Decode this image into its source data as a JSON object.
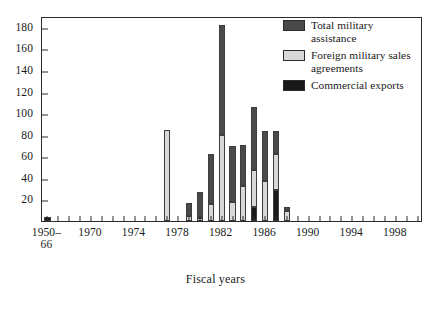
{
  "chart_data": {
    "type": "bar",
    "stacked": true,
    "title": "",
    "xlabel": "Fiscal years",
    "ylabel": "",
    "ylim": [
      0,
      190
    ],
    "yticks": [
      20,
      40,
      60,
      80,
      100,
      120,
      140,
      160,
      180
    ],
    "grid": false,
    "legend_position": "top-right",
    "categories": [
      "1950–66",
      "1967",
      "1968",
      "1969",
      "1970",
      "1971",
      "1972",
      "1973",
      "1974",
      "1975",
      "1976",
      "1977",
      "1978",
      "1979",
      "1980",
      "1981",
      "1982",
      "1983",
      "1984",
      "1985",
      "1986",
      "1987",
      "1988",
      "1989",
      "1990",
      "1991",
      "1992",
      "1993",
      "1994",
      "1995",
      "1996",
      "1997",
      "1998",
      "1999",
      "2000"
    ],
    "xtick_labels": [
      "1950–\n66",
      "1970",
      "1974",
      "1978",
      "1982",
      "1986",
      "1990",
      "1994",
      "1998"
    ],
    "xtick_categories": [
      "1950–66",
      "1970",
      "1974",
      "1978",
      "1982",
      "1986",
      "1990",
      "1994",
      "1998"
    ],
    "series": [
      {
        "name": "Commercial exports",
        "color": "#191919",
        "values": [
          4,
          0,
          0,
          0,
          0,
          0,
          0,
          0,
          0,
          0,
          0,
          0,
          0,
          0,
          0,
          0,
          0,
          0,
          0,
          13,
          0,
          29,
          0,
          0,
          0,
          0,
          0,
          0,
          0,
          0,
          0,
          0,
          0,
          0,
          0
        ]
      },
      {
        "name": "Foreign military sales agreements",
        "color": "#d8d8d6",
        "values": [
          0,
          0,
          0,
          0,
          0,
          0,
          0,
          0,
          0,
          0,
          0,
          84,
          0,
          5,
          3,
          16,
          80,
          18,
          32,
          34,
          37,
          33,
          9,
          0,
          0,
          0,
          0,
          0,
          0,
          0,
          0,
          0,
          0,
          0,
          0
        ]
      },
      {
        "name": "Total military assistance",
        "color": "#4a4a4a",
        "values": [
          0,
          0,
          0,
          0,
          0,
          0,
          0,
          0,
          0,
          0,
          0,
          0,
          0,
          12,
          24,
          46,
          102,
          52,
          38,
          59,
          46,
          21,
          4,
          0,
          0,
          0,
          0,
          0,
          0,
          0,
          0,
          0,
          0,
          0,
          0
        ]
      }
    ],
    "bar_totals": [
      4,
      0,
      0,
      0,
      0,
      0,
      0,
      0,
      0,
      0,
      0,
      84,
      0,
      17,
      27,
      62,
      182,
      70,
      70,
      106,
      83,
      83,
      13,
      0,
      0,
      0,
      0,
      0,
      0,
      0,
      0,
      0,
      0,
      0,
      0
    ]
  },
  "legend": {
    "items": [
      {
        "label": "Total military assistance",
        "swatch": "legend-swatch-total-military-assistance"
      },
      {
        "label": "Foreign military sales agreements",
        "swatch": "legend-swatch-foreign-military-sales"
      },
      {
        "label": "Commercial exports",
        "swatch": "legend-swatch-commercial-exports"
      }
    ]
  },
  "colors": {
    "total_military_assistance": "#4a4a4a",
    "foreign_military_sales": "#d8d8d6",
    "commercial_exports": "#191919",
    "axis": "#2b2b2b",
    "background": "#ffffff"
  }
}
